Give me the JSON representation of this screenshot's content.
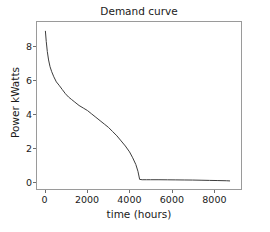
{
  "chart_data": {
    "type": "line",
    "title": "Demand curve",
    "xlabel": "time (hours)",
    "ylabel": "Power kWatts",
    "xlim": [
      -400,
      9300
    ],
    "ylim": [
      -0.45,
      9.45
    ],
    "xticks": [
      0,
      2000,
      4000,
      6000,
      8000
    ],
    "xtick_labels": [
      "0",
      "2000",
      "4000",
      "6000",
      "8000"
    ],
    "yticks": [
      0,
      2,
      4,
      6,
      8
    ],
    "ytick_labels": [
      "0",
      "2",
      "4",
      "6",
      "8"
    ],
    "grid": false,
    "legend": null,
    "line_color": "#3c3c3c",
    "line_width": 1,
    "axes_color": "#9a9a9a",
    "background_color": "#ffffff",
    "series": [
      {
        "name": "demand",
        "x": [
          0,
          40,
          90,
          150,
          220,
          300,
          400,
          520,
          650,
          800,
          950,
          1100,
          1250,
          1400,
          1600,
          1800,
          2000,
          2200,
          2400,
          2600,
          2800,
          3000,
          3200,
          3400,
          3600,
          3800,
          4000,
          4150,
          4300,
          4400,
          4480,
          4600,
          4800,
          5000,
          5400,
          5800,
          6200,
          6600,
          7000,
          7400,
          7800,
          8200,
          8600,
          8760
        ],
        "y": [
          8.9,
          8.3,
          7.7,
          7.2,
          6.8,
          6.5,
          6.2,
          5.9,
          5.7,
          5.45,
          5.2,
          5.0,
          4.85,
          4.7,
          4.5,
          4.35,
          4.2,
          4.0,
          3.8,
          3.6,
          3.4,
          3.2,
          2.95,
          2.7,
          2.4,
          2.1,
          1.75,
          1.4,
          1.0,
          0.6,
          0.12,
          0.1,
          0.1,
          0.1,
          0.1,
          0.095,
          0.09,
          0.085,
          0.08,
          0.07,
          0.06,
          0.05,
          0.04,
          0.03
        ]
      }
    ],
    "annotations": []
  }
}
